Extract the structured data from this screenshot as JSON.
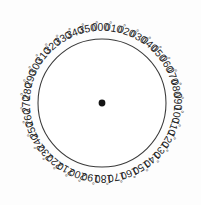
{
  "figure": {
    "type": "compass-rose",
    "background_color": "#fdfdfd",
    "line_color": "#5a5a5a",
    "axis_color": "#1d1d1d",
    "rim_color": "#3a3a3a",
    "label_color": "#242424",
    "degree_symbol": "°"
  },
  "chart_data": {
    "type": "polar-grid",
    "center": {
      "x": 102,
      "y": 103
    },
    "radius": 64,
    "label_radius": 76,
    "spoke_count": 36,
    "spoke_step_degrees": 10,
    "angle_origin": "top",
    "angle_direction": "clockwise",
    "major_axes_degrees": [
      0,
      90,
      180,
      270
    ],
    "grid": true,
    "legend": "none",
    "labels": [
      {
        "deg": 0,
        "text": "000"
      },
      {
        "deg": 10,
        "text": "010"
      },
      {
        "deg": 20,
        "text": "020"
      },
      {
        "deg": 30,
        "text": "030"
      },
      {
        "deg": 40,
        "text": "040"
      },
      {
        "deg": 50,
        "text": "050"
      },
      {
        "deg": 60,
        "text": "060"
      },
      {
        "deg": 70,
        "text": "070"
      },
      {
        "deg": 80,
        "text": "080"
      },
      {
        "deg": 90,
        "text": "090"
      },
      {
        "deg": 100,
        "text": "100"
      },
      {
        "deg": 110,
        "text": "110"
      },
      {
        "deg": 120,
        "text": "120"
      },
      {
        "deg": 130,
        "text": "130"
      },
      {
        "deg": 140,
        "text": "140"
      },
      {
        "deg": 150,
        "text": "150"
      },
      {
        "deg": 160,
        "text": "160"
      },
      {
        "deg": 170,
        "text": "170"
      },
      {
        "deg": 180,
        "text": "180"
      },
      {
        "deg": 190,
        "text": "190"
      },
      {
        "deg": 200,
        "text": "200"
      },
      {
        "deg": 210,
        "text": "210"
      },
      {
        "deg": 220,
        "text": "220"
      },
      {
        "deg": 230,
        "text": "230"
      },
      {
        "deg": 240,
        "text": "240"
      },
      {
        "deg": 250,
        "text": "250"
      },
      {
        "deg": 260,
        "text": "260"
      },
      {
        "deg": 270,
        "text": "270"
      },
      {
        "deg": 280,
        "text": "280"
      },
      {
        "deg": 290,
        "text": "290"
      },
      {
        "deg": 300,
        "text": "300"
      },
      {
        "deg": 310,
        "text": "310"
      },
      {
        "deg": 320,
        "text": "320"
      },
      {
        "deg": 330,
        "text": "330"
      },
      {
        "deg": 340,
        "text": "340"
      },
      {
        "deg": 350,
        "text": "350"
      }
    ]
  }
}
